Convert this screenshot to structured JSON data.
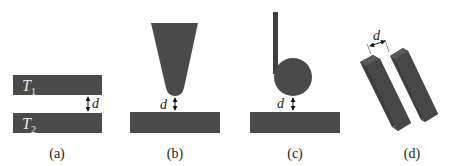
{
  "colors": {
    "body_fill": "#4a4a4a",
    "body_fill_dark": "#3b3b3b",
    "block_side": "#2f2f2f",
    "block_top": "#5a5a5a",
    "text": "#222222",
    "background": "#ffffff"
  },
  "panels": [
    {
      "id": "a",
      "caption": "(a)",
      "description": "Two parallel plates separated by gap d",
      "top_plate_label": "T",
      "top_plate_subscript": "1",
      "bottom_plate_label": "T",
      "bottom_plate_subscript": "2",
      "gap_label": "d"
    },
    {
      "id": "b",
      "caption": "(b)",
      "description": "Conical tip above a plate separated by gap d",
      "gap_label": "d"
    },
    {
      "id": "c",
      "caption": "(c)",
      "description": "Sphere on a cantilever above a plate separated by gap d",
      "gap_label": "d"
    },
    {
      "id": "d",
      "caption": "(d)",
      "description": "Two parallel tilted rectangular bars separated by gap d",
      "gap_label": "d"
    }
  ]
}
